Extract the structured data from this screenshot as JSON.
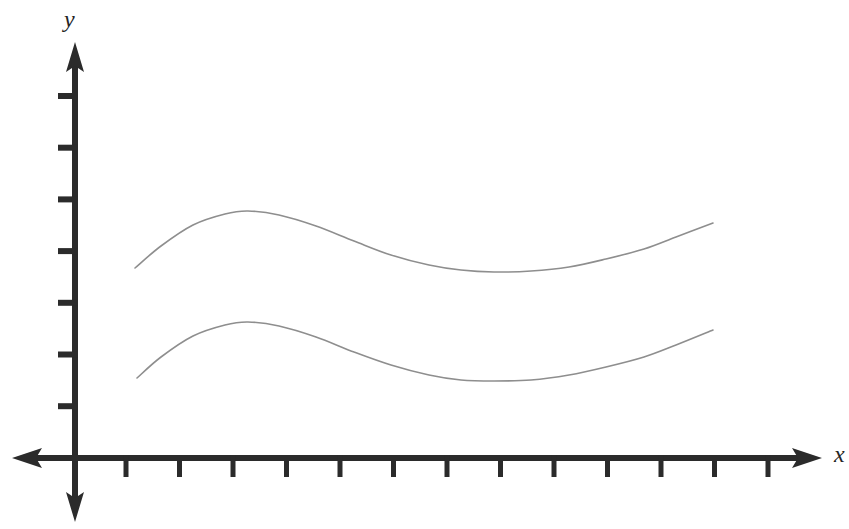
{
  "figure": {
    "background_color": "#ffffff",
    "axis_color": "#2b2b2b",
    "curve_color": "#8e8e8e",
    "y_axis_label": "y",
    "x_axis_label": "x"
  },
  "chart_data": {
    "type": "line",
    "title": "",
    "subtitle": "",
    "xlabel": "x",
    "ylabel": "y",
    "grid": false,
    "legend": "none",
    "annotations": [],
    "axes": {
      "origin_px": [
        75,
        458
      ],
      "x_axis": {
        "label": "x",
        "tick_labels": [],
        "tick_count": 13,
        "tick_spacing_px": 53.5,
        "first_tick_px": 126,
        "arrow_both_ends": true,
        "range_px": [
          12,
          820
        ]
      },
      "y_axis": {
        "label": "y",
        "tick_labels": [],
        "tick_count": 7,
        "tick_spacing_px": 51.7,
        "first_tick_px": 96,
        "arrow_both_ends": true,
        "range_px": [
          45,
          520
        ]
      },
      "xlim": [
        0,
        14
      ],
      "ylim": [
        0,
        8
      ]
    },
    "series": [
      {
        "name": "upper-curve",
        "comment": "wavy curve: rises to a crest, dips to a trough, rises again",
        "color": "#8e8e8e",
        "x": [
          1.12,
          1.6,
          2.2,
          2.8,
          3.23,
          3.8,
          4.5,
          5.2,
          5.9,
          6.6,
          7.2,
          7.8,
          8.5,
          9.2,
          9.9,
          10.6,
          11.2,
          11.92
        ],
        "y": [
          3.68,
          4.09,
          4.48,
          4.69,
          4.74,
          4.67,
          4.46,
          4.18,
          3.92,
          3.73,
          3.63,
          3.6,
          3.62,
          3.7,
          3.84,
          4.04,
          4.26,
          4.53
        ],
        "points_px": [
          [
            135,
            268
          ],
          [
            161,
            246
          ],
          [
            193,
            225
          ],
          [
            225,
            214
          ],
          [
            248,
            211
          ],
          [
            279,
            215
          ],
          [
            316,
            226
          ],
          [
            354,
            241
          ],
          [
            391,
            255
          ],
          [
            429,
            265
          ],
          [
            461,
            270
          ],
          [
            494,
            272
          ],
          [
            531,
            271
          ],
          [
            569,
            267
          ],
          [
            606,
            259
          ],
          [
            644,
            249
          ],
          [
            676,
            237
          ],
          [
            713,
            223
          ]
        ]
      },
      {
        "name": "lower-curve",
        "comment": "parallel wavy curve offset downward by about 110 px",
        "color": "#8e8e8e",
        "x": [
          1.16,
          1.6,
          2.2,
          2.8,
          3.23,
          3.8,
          4.5,
          5.2,
          5.9,
          6.6,
          7.2,
          7.8,
          8.5,
          9.2,
          9.9,
          10.6,
          11.2,
          11.92
        ],
        "y": [
          1.55,
          1.96,
          2.35,
          2.56,
          2.61,
          2.54,
          2.33,
          2.05,
          1.79,
          1.61,
          1.52,
          1.5,
          1.53,
          1.62,
          1.77,
          1.97,
          2.2,
          2.49
        ],
        "points_px": [
          [
            137,
            378
          ],
          [
            161,
            357
          ],
          [
            193,
            336
          ],
          [
            225,
            325
          ],
          [
            248,
            322
          ],
          [
            279,
            326
          ],
          [
            316,
            337
          ],
          [
            354,
            352
          ],
          [
            391,
            365
          ],
          [
            429,
            375
          ],
          [
            461,
            380
          ],
          [
            494,
            381
          ],
          [
            531,
            380
          ],
          [
            569,
            375
          ],
          [
            606,
            367
          ],
          [
            644,
            357
          ],
          [
            676,
            345
          ],
          [
            713,
            330
          ]
        ]
      }
    ]
  }
}
